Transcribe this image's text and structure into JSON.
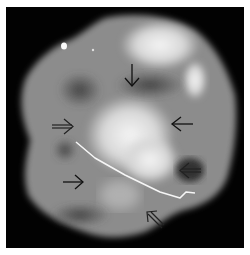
{
  "image": {
    "type": "specimen radiograph",
    "background_color": "#020202",
    "border_color": "#ffffff",
    "tissue_color": "#8a8a8a",
    "bright_region_color": "#e8e8e8",
    "arrow_color": "#111111"
  },
  "annotations": {
    "arrows": [
      {
        "name": "arrow-down-top-center",
        "direction": "down",
        "style": "solid",
        "x": 131,
        "y": 68
      },
      {
        "name": "arrow-right-left-middle",
        "direction": "right",
        "style": "outlined",
        "x": 62,
        "y": 126
      },
      {
        "name": "arrow-left-right-middle",
        "direction": "left",
        "style": "solid",
        "x": 183,
        "y": 124
      },
      {
        "name": "arrow-left-lower-right",
        "direction": "left",
        "style": "outlined",
        "x": 190,
        "y": 170
      },
      {
        "name": "arrow-right-lower-left",
        "direction": "right",
        "style": "solid",
        "x": 73,
        "y": 182
      },
      {
        "name": "arrow-up-left-bottom",
        "direction": "up-left",
        "style": "outlined",
        "x": 152,
        "y": 218
      }
    ],
    "localization_wire": {
      "visible": true
    }
  }
}
